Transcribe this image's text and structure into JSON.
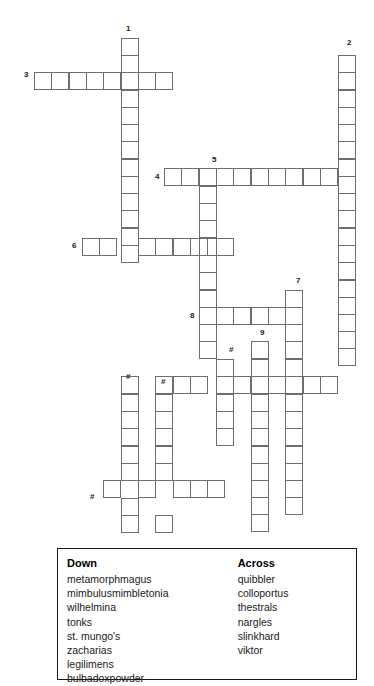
{
  "puzzle": {
    "type": "crossword",
    "cell_size": 17.3,
    "grid_origin": {
      "x": 121,
      "y": 38
    },
    "border_color": "#6e6e6e",
    "background_color": "#ffffff",
    "numbers": [
      {
        "label": "1",
        "x": 126,
        "y": 24,
        "align": "center"
      },
      {
        "label": "2",
        "x": 347,
        "y": 38,
        "align": "center"
      },
      {
        "label": "3",
        "x": 24,
        "y": 70,
        "align": "left"
      },
      {
        "label": "4",
        "x": 155,
        "y": 172,
        "align": "left"
      },
      {
        "label": "5",
        "x": 212,
        "y": 155,
        "align": "center"
      },
      {
        "label": "6",
        "x": 72,
        "y": 241,
        "align": "left"
      },
      {
        "label": "7",
        "x": 296,
        "y": 276,
        "align": "center"
      },
      {
        "label": "8",
        "x": 190,
        "y": 311,
        "align": "left"
      },
      {
        "label": "9",
        "x": 260,
        "y": 328,
        "align": "center"
      },
      {
        "label": "#",
        "x": 229,
        "y": 345,
        "align": "center"
      },
      {
        "label": "#",
        "x": 126,
        "y": 372,
        "align": "center"
      },
      {
        "label": "#",
        "x": 161,
        "y": 377,
        "align": "center"
      },
      {
        "label": "#",
        "x": 90,
        "y": 492,
        "align": "left"
      }
    ],
    "entries": [
      {
        "number": "1",
        "direction": "down",
        "length": 13,
        "col": 0,
        "row": 0
      },
      {
        "number": "2",
        "direction": "down",
        "length": 18,
        "col": 13,
        "row": 1
      },
      {
        "number": "3",
        "direction": "across",
        "length": 8,
        "col": -5,
        "row": 2
      },
      {
        "number": "4",
        "direction": "across",
        "length": 11,
        "col": 2,
        "row": 8
      },
      {
        "number": "5",
        "direction": "down",
        "length": 13,
        "col": 5,
        "row": 8
      },
      {
        "number": "6",
        "direction": "across",
        "length": 9,
        "col": -3,
        "row": 12
      },
      {
        "number": "7",
        "direction": "down",
        "length": 13,
        "col": 10,
        "row": 15
      },
      {
        "number": "8",
        "direction": "across",
        "length": 6,
        "col": 4,
        "row": 16
      },
      {
        "number": "9",
        "direction": "down",
        "length": 13,
        "col": 8,
        "row": 18
      },
      {
        "number": "#",
        "direction": "down",
        "length": 7,
        "col": 6,
        "row": 19
      },
      {
        "number": "#",
        "direction": "down",
        "length": 9,
        "col": 0,
        "row": 21
      },
      {
        "number": "#",
        "direction": "down",
        "length": 9,
        "col": 2,
        "row": 21
      },
      {
        "number": "#",
        "direction": "across",
        "length": 10,
        "col": 2,
        "row": 22
      },
      {
        "number": "#",
        "direction": "across",
        "length": 8,
        "col": -1,
        "row": 28
      }
    ],
    "cells": [
      [
        121,
        38
      ],
      [
        121,
        55
      ],
      [
        121,
        72
      ],
      [
        121,
        90
      ],
      [
        121,
        107
      ],
      [
        121,
        124
      ],
      [
        121,
        141
      ],
      [
        121,
        159
      ],
      [
        121,
        176
      ],
      [
        121,
        193
      ],
      [
        121,
        210
      ],
      [
        121,
        228
      ],
      [
        121,
        245
      ],
      [
        338,
        55
      ],
      [
        338,
        72
      ],
      [
        338,
        90
      ],
      [
        338,
        107
      ],
      [
        338,
        124
      ],
      [
        338,
        141
      ],
      [
        338,
        159
      ],
      [
        338,
        176
      ],
      [
        338,
        193
      ],
      [
        338,
        210
      ],
      [
        338,
        228
      ],
      [
        338,
        245
      ],
      [
        338,
        262
      ],
      [
        338,
        280
      ],
      [
        338,
        297
      ],
      [
        338,
        314
      ],
      [
        338,
        331
      ],
      [
        338,
        348
      ],
      [
        34,
        72
      ],
      [
        51,
        72
      ],
      [
        69,
        72
      ],
      [
        86,
        72
      ],
      [
        103,
        72
      ],
      [
        138,
        72
      ],
      [
        155,
        72
      ],
      [
        164,
        168
      ],
      [
        181,
        168
      ],
      [
        199,
        168
      ],
      [
        216,
        168
      ],
      [
        233,
        168
      ],
      [
        251,
        168
      ],
      [
        268,
        168
      ],
      [
        285,
        168
      ],
      [
        303,
        168
      ],
      [
        320,
        168
      ],
      [
        199,
        186
      ],
      [
        199,
        203
      ],
      [
        199,
        220
      ],
      [
        199,
        238
      ],
      [
        199,
        255
      ],
      [
        199,
        272
      ],
      [
        199,
        290
      ],
      [
        199,
        307
      ],
      [
        199,
        324
      ],
      [
        199,
        341
      ],
      [
        82,
        238
      ],
      [
        99,
        238
      ],
      [
        138,
        238
      ],
      [
        155,
        238
      ],
      [
        173,
        238
      ],
      [
        190,
        238
      ],
      [
        216,
        238
      ],
      [
        285,
        290
      ],
      [
        285,
        307
      ],
      [
        285,
        324
      ],
      [
        285,
        341
      ],
      [
        285,
        359
      ],
      [
        285,
        376
      ],
      [
        285,
        394
      ],
      [
        285,
        411
      ],
      [
        285,
        428
      ],
      [
        285,
        446
      ],
      [
        285,
        463
      ],
      [
        285,
        480
      ],
      [
        285,
        497
      ],
      [
        216,
        307
      ],
      [
        233,
        307
      ],
      [
        251,
        307
      ],
      [
        268,
        307
      ],
      [
        251,
        341
      ],
      [
        251,
        359
      ],
      [
        251,
        376
      ],
      [
        251,
        394
      ],
      [
        251,
        411
      ],
      [
        251,
        428
      ],
      [
        251,
        446
      ],
      [
        251,
        463
      ],
      [
        251,
        480
      ],
      [
        251,
        497
      ],
      [
        251,
        514
      ],
      [
        216,
        359
      ],
      [
        216,
        376
      ],
      [
        216,
        394
      ],
      [
        216,
        411
      ],
      [
        216,
        428
      ],
      [
        121,
        376
      ],
      [
        121,
        394
      ],
      [
        121,
        411
      ],
      [
        121,
        428
      ],
      [
        121,
        446
      ],
      [
        121,
        463
      ],
      [
        121,
        498
      ],
      [
        121,
        515
      ],
      [
        155,
        376
      ],
      [
        155,
        394
      ],
      [
        155,
        411
      ],
      [
        155,
        428
      ],
      [
        155,
        446
      ],
      [
        155,
        463
      ],
      [
        155,
        515
      ],
      [
        173,
        376
      ],
      [
        190,
        376
      ],
      [
        233,
        376
      ],
      [
        268,
        376
      ],
      [
        303,
        376
      ],
      [
        320,
        376
      ],
      [
        103,
        480
      ],
      [
        138,
        480
      ],
      [
        173,
        480
      ],
      [
        190,
        480
      ],
      [
        207,
        480
      ]
    ]
  },
  "word_list": {
    "down": {
      "heading": "Down",
      "words": [
        "metamorphmagus",
        "mimbulusmimbletonia",
        "wilhelmina",
        "tonks",
        "st. mungo's",
        "zacharias",
        "legilimens",
        "bulbadoxpowder"
      ]
    },
    "across": {
      "heading": "Across",
      "words": [
        "quibbler",
        "colloportus",
        "thestrals",
        "nargles",
        "slinkhard",
        "viktor"
      ]
    }
  }
}
